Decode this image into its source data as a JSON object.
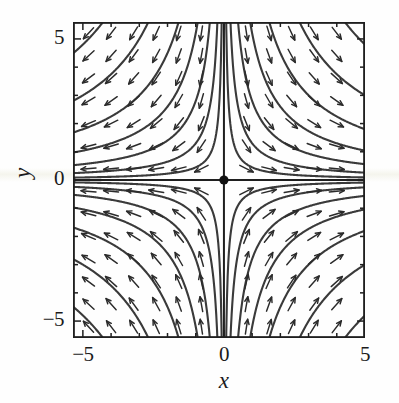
{
  "figure": {
    "kind": "phase-portrait",
    "ink_color": "#2b2b2b",
    "frame_color": "#1f1f1f",
    "background_color": "#fefefe"
  },
  "axes": {
    "x_title": "x",
    "y_title": "y",
    "x_ticks": [
      {
        "value": -5,
        "label": "−5"
      },
      {
        "value": 0,
        "label": "0"
      },
      {
        "value": 5,
        "label": "5"
      }
    ],
    "y_ticks": [
      {
        "value": 5,
        "label": "5"
      },
      {
        "value": 0,
        "label": "0"
      },
      {
        "value": -5,
        "label": "−5"
      }
    ],
    "minor_tick_step": 1,
    "xlim": [
      -5.35,
      5.0
    ],
    "ylim": [
      -5.6,
      5.6
    ],
    "grid": false
  },
  "chart_data": {
    "type": "scatter",
    "title": "",
    "subtitle": "",
    "xlabel": "x",
    "ylabel": "y",
    "xlim": [
      -5.35,
      5.0
    ],
    "ylim": [
      -5.6,
      5.6
    ],
    "grid": false,
    "legend": null,
    "xticks": [
      -5,
      0,
      5
    ],
    "yticks": [
      -5,
      0,
      5
    ],
    "xticklabels": [
      "−5",
      "0",
      "5"
    ],
    "yticklabels": [
      "−5",
      "0",
      "5"
    ],
    "system": {
      "dx_dt": "x",
      "dy_dt": "-y",
      "classification": "saddle point",
      "equilibrium": [
        0,
        0
      ],
      "trajectory_family": "x*y = C"
    },
    "equilibrium_points": [
      {
        "x": 0,
        "y": 0,
        "marker": "filled-circle",
        "type": "saddle"
      }
    ],
    "separatrices": [
      {
        "name": "unstable-manifold",
        "along": "x-axis",
        "direction": "outward"
      },
      {
        "name": "stable-manifold",
        "along": "y-axis",
        "direction": "inward"
      }
    ],
    "trajectory_constants": [
      0.45,
      1.3,
      2.8,
      5.2,
      9.0,
      15.0,
      24.0
    ],
    "direction_field": {
      "arrow_grid_x": [
        -4.8,
        -4.0,
        -3.2,
        -2.4,
        -1.6,
        -0.8,
        0.8,
        1.6,
        2.4,
        3.2,
        4.0,
        4.8
      ],
      "arrow_grid_y": [
        -5.2,
        -4.4,
        -3.6,
        -2.8,
        -2.0,
        -1.2,
        -0.4,
        0.4,
        1.2,
        2.0,
        2.8,
        3.6,
        4.4,
        5.2
      ],
      "quadrant_flow": {
        "I": "down-right",
        "II": "down-left",
        "III": "up-left",
        "IV": "up-right"
      }
    }
  }
}
